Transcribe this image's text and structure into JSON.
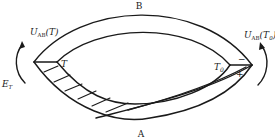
{
  "diagram": {
    "type": "thermocouple-circuit",
    "labels": {
      "conductor_top": "B",
      "conductor_bottom": "A",
      "hot_junction_temp": "T",
      "cold_junction_temp": "T",
      "cold_junction_sub": "0",
      "contact_emf_hot_U": "U",
      "contact_emf_hot_sub": "AB",
      "contact_emf_hot_arg": "(T)",
      "contact_emf_cold_U": "U",
      "contact_emf_cold_sub": "AB",
      "contact_emf_cold_arg_open": "(T",
      "contact_emf_cold_arg_sub": "0",
      "contact_emf_cold_arg_close": ")",
      "thermo_emf_E": "E",
      "thermo_emf_sub": "T",
      "polarity_minus": "−",
      "polarity_plus": "+"
    },
    "colors": {
      "stroke": "#1a1a1a",
      "background": "#ffffff"
    }
  }
}
